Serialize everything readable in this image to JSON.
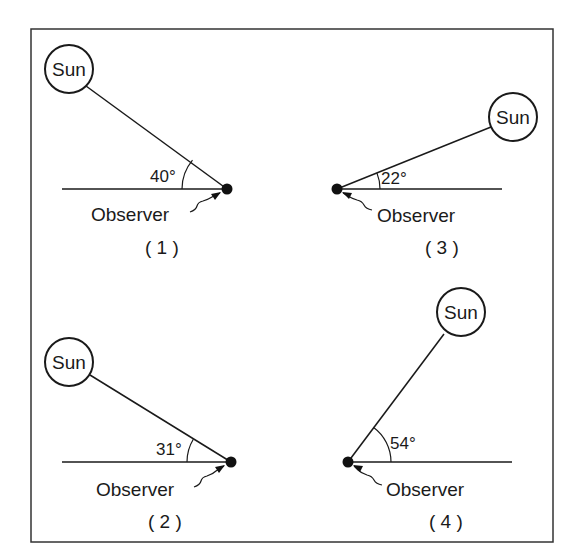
{
  "diagram": {
    "type": "sun-angle-comparison",
    "frame": {
      "x": 31,
      "y": 29,
      "width": 522,
      "height": 513
    },
    "panels": [
      {
        "id": "1",
        "label": "( 1 )",
        "sun_label": "Sun",
        "observer_label": "Observer",
        "angle_label": "40°",
        "angle_deg": 40,
        "sun_side": "left",
        "sun": {
          "cx": 69,
          "cy": 69,
          "r": 24
        },
        "observer": {
          "x": 227,
          "y": 189
        },
        "horizon": {
          "x1": 62,
          "x2": 227
        },
        "angle_text_pos": {
          "x": 150,
          "y": 182
        },
        "observer_text_pos": {
          "x": 91,
          "y": 221
        },
        "number_text_pos": {
          "x": 145,
          "y": 254
        }
      },
      {
        "id": "3",
        "label": "( 3 )",
        "sun_label": "Sun",
        "observer_label": "Observer",
        "angle_label": "22°",
        "angle_deg": 22,
        "sun_side": "right",
        "sun": {
          "cx": 513,
          "cy": 117,
          "r": 24
        },
        "observer": {
          "x": 337,
          "y": 189
        },
        "horizon": {
          "x1": 337,
          "x2": 502
        },
        "angle_text_pos": {
          "x": 381,
          "y": 184
        },
        "observer_text_pos": {
          "x": 377,
          "y": 222
        },
        "number_text_pos": {
          "x": 425,
          "y": 254
        }
      },
      {
        "id": "2",
        "label": "( 2 )",
        "sun_label": "Sun",
        "observer_label": "Observer",
        "angle_label": "31°",
        "angle_deg": 31,
        "sun_side": "left",
        "sun": {
          "cx": 69,
          "cy": 362,
          "r": 24
        },
        "observer": {
          "x": 231,
          "y": 462
        },
        "horizon": {
          "x1": 62,
          "x2": 231
        },
        "angle_text_pos": {
          "x": 156,
          "y": 455
        },
        "observer_text_pos": {
          "x": 96,
          "y": 496
        },
        "number_text_pos": {
          "x": 148,
          "y": 528
        }
      },
      {
        "id": "4",
        "label": "( 4 )",
        "sun_label": "Sun",
        "observer_label": "Observer",
        "angle_label": "54°",
        "angle_deg": 54,
        "sun_side": "right",
        "sun": {
          "cx": 461,
          "cy": 312,
          "r": 24
        },
        "observer": {
          "x": 348,
          "y": 462
        },
        "horizon": {
          "x1": 348,
          "x2": 512
        },
        "angle_text_pos": {
          "x": 390,
          "y": 449
        },
        "observer_text_pos": {
          "x": 386,
          "y": 496
        },
        "number_text_pos": {
          "x": 429,
          "y": 528
        }
      }
    ]
  }
}
